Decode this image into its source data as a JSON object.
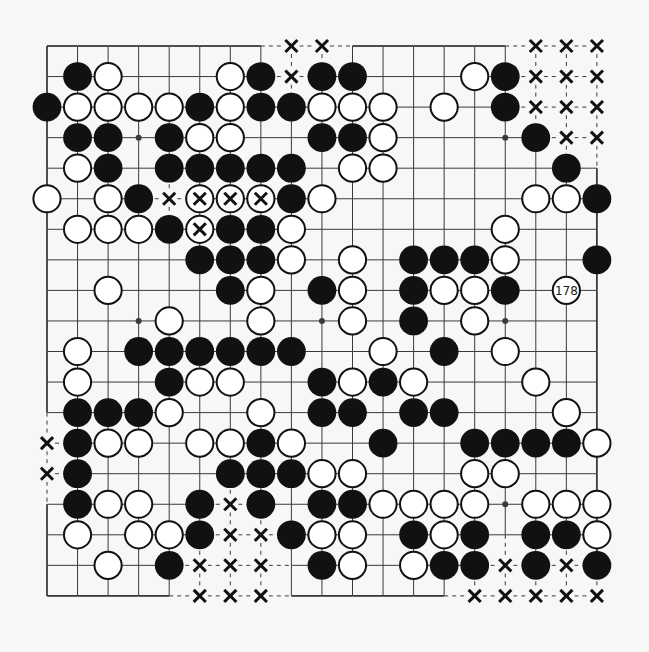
{
  "diagram": {
    "type": "go-board",
    "size": 19,
    "colors": {
      "background": "#f7f7f5",
      "line": "#3a3a3a",
      "black_stone": "#111111",
      "white_stone_fill": "#ffffff",
      "white_stone_stroke": "#111111",
      "mark": "#111111"
    },
    "hoshi": [
      [
        3,
        3
      ],
      [
        3,
        9
      ],
      [
        3,
        15
      ],
      [
        9,
        3
      ],
      [
        9,
        9
      ],
      [
        9,
        15
      ],
      [
        15,
        3
      ],
      [
        15,
        9
      ],
      [
        15,
        15
      ]
    ],
    "rows": [
      {
        "row": 0,
        "stones": [
          [
            "X",
            8
          ],
          [
            "X",
            9
          ],
          [
            "X",
            16
          ],
          [
            "X",
            17
          ],
          [
            "X",
            18
          ]
        ]
      },
      {
        "row": 1,
        "stones": [
          [
            "B",
            1
          ],
          [
            "W",
            2
          ],
          [
            "W",
            6
          ],
          [
            "B",
            7
          ],
          [
            "X",
            8
          ],
          [
            "B",
            9
          ],
          [
            "B",
            10
          ],
          [
            "W",
            14
          ],
          [
            "B",
            15
          ],
          [
            "X",
            16
          ],
          [
            "X",
            17
          ],
          [
            "X",
            18
          ]
        ]
      },
      {
        "row": 2,
        "stones": [
          [
            "B",
            0
          ],
          [
            "W",
            1
          ],
          [
            "W",
            2
          ],
          [
            "W",
            3
          ],
          [
            "W",
            4
          ],
          [
            "B",
            5
          ],
          [
            "W",
            6
          ],
          [
            "B",
            7
          ],
          [
            "B",
            8
          ],
          [
            "W",
            9
          ],
          [
            "W",
            10
          ],
          [
            "W",
            11
          ],
          [
            "W",
            13
          ],
          [
            "B",
            15
          ],
          [
            "X",
            16
          ],
          [
            "X",
            17
          ],
          [
            "X",
            18
          ]
        ]
      },
      {
        "row": 3,
        "stones": [
          [
            "B",
            1
          ],
          [
            "B",
            2
          ],
          [
            "B",
            4
          ],
          [
            "W",
            5
          ],
          [
            "W",
            6
          ],
          [
            "B",
            9
          ],
          [
            "B",
            10
          ],
          [
            "W",
            11
          ],
          [
            "B",
            16
          ],
          [
            "X",
            17
          ],
          [
            "X",
            18
          ]
        ]
      },
      {
        "row": 4,
        "stones": [
          [
            "W",
            1
          ],
          [
            "B",
            2
          ],
          [
            "B",
            4
          ],
          [
            "B",
            5
          ],
          [
            "B",
            6
          ],
          [
            "B",
            7
          ],
          [
            "B",
            8
          ],
          [
            "W",
            10
          ],
          [
            "W",
            11
          ],
          [
            "B",
            17
          ]
        ]
      },
      {
        "row": 5,
        "stones": [
          [
            "W",
            0
          ],
          [
            "W",
            2
          ],
          [
            "B",
            3
          ],
          [
            "X",
            4
          ],
          [
            "WX",
            5
          ],
          [
            "WX",
            6
          ],
          [
            "WX",
            7
          ],
          [
            "B",
            8
          ],
          [
            "W",
            9
          ],
          [
            "W",
            16
          ],
          [
            "W",
            17
          ],
          [
            "B",
            18
          ]
        ]
      },
      {
        "row": 6,
        "stones": [
          [
            "W",
            1
          ],
          [
            "W",
            2
          ],
          [
            "W",
            3
          ],
          [
            "B",
            4
          ],
          [
            "WX",
            5
          ],
          [
            "B",
            6
          ],
          [
            "B",
            7
          ],
          [
            "W",
            8
          ],
          [
            "W",
            15
          ]
        ]
      },
      {
        "row": 7,
        "stones": [
          [
            "B",
            5
          ],
          [
            "B",
            6
          ],
          [
            "B",
            7
          ],
          [
            "W",
            8
          ],
          [
            "W",
            10
          ],
          [
            "B",
            12
          ],
          [
            "B",
            13
          ],
          [
            "B",
            14
          ],
          [
            "W",
            15
          ],
          [
            "B",
            18
          ]
        ]
      },
      {
        "row": 8,
        "stones": [
          [
            "W",
            2
          ],
          [
            "B",
            6
          ],
          [
            "W",
            7
          ],
          [
            "B",
            9
          ],
          [
            "W",
            10
          ],
          [
            "B",
            12
          ],
          [
            "W",
            13
          ],
          [
            "W",
            14
          ],
          [
            "B",
            15
          ],
          [
            "N",
            17,
            "178"
          ]
        ]
      },
      {
        "row": 9,
        "stones": [
          [
            "W",
            4
          ],
          [
            "W",
            7
          ],
          [
            "W",
            10
          ],
          [
            "B",
            12
          ],
          [
            "W",
            14
          ]
        ]
      },
      {
        "row": 10,
        "stones": [
          [
            "W",
            1
          ],
          [
            "B",
            3
          ],
          [
            "B",
            4
          ],
          [
            "B",
            5
          ],
          [
            "B",
            6
          ],
          [
            "B",
            7
          ],
          [
            "B",
            8
          ],
          [
            "W",
            11
          ],
          [
            "B",
            13
          ],
          [
            "W",
            15
          ]
        ]
      },
      {
        "row": 11,
        "stones": [
          [
            "W",
            1
          ],
          [
            "B",
            4
          ],
          [
            "W",
            5
          ],
          [
            "W",
            6
          ],
          [
            "B",
            9
          ],
          [
            "W",
            10
          ],
          [
            "B",
            11
          ],
          [
            "W",
            12
          ],
          [
            "W",
            16
          ]
        ]
      },
      {
        "row": 12,
        "stones": [
          [
            "B",
            1
          ],
          [
            "B",
            2
          ],
          [
            "B",
            3
          ],
          [
            "W",
            4
          ],
          [
            "W",
            7
          ],
          [
            "B",
            9
          ],
          [
            "B",
            10
          ],
          [
            "B",
            12
          ],
          [
            "B",
            13
          ],
          [
            "W",
            17
          ]
        ]
      },
      {
        "row": 13,
        "stones": [
          [
            "X",
            0
          ],
          [
            "B",
            1
          ],
          [
            "W",
            2
          ],
          [
            "W",
            3
          ],
          [
            "W",
            5
          ],
          [
            "W",
            6
          ],
          [
            "B",
            7
          ],
          [
            "W",
            8
          ],
          [
            "B",
            11
          ],
          [
            "B",
            14
          ],
          [
            "B",
            15
          ],
          [
            "B",
            16
          ],
          [
            "B",
            17
          ],
          [
            "W",
            18
          ]
        ]
      },
      {
        "row": 14,
        "stones": [
          [
            "X",
            0
          ],
          [
            "B",
            1
          ],
          [
            "B",
            6
          ],
          [
            "B",
            7
          ],
          [
            "B",
            8
          ],
          [
            "W",
            9
          ],
          [
            "W",
            10
          ],
          [
            "W",
            14
          ],
          [
            "W",
            15
          ]
        ]
      },
      {
        "row": 15,
        "stones": [
          [
            "B",
            1
          ],
          [
            "W",
            2
          ],
          [
            "W",
            3
          ],
          [
            "B",
            5
          ],
          [
            "X",
            6
          ],
          [
            "B",
            7
          ],
          [
            "B",
            9
          ],
          [
            "B",
            10
          ],
          [
            "W",
            11
          ],
          [
            "W",
            12
          ],
          [
            "W",
            13
          ],
          [
            "W",
            14
          ],
          [
            "W",
            16
          ],
          [
            "W",
            17
          ],
          [
            "W",
            18
          ]
        ]
      },
      {
        "row": 16,
        "stones": [
          [
            "W",
            1
          ],
          [
            "W",
            3
          ],
          [
            "W",
            4
          ],
          [
            "B",
            5
          ],
          [
            "X",
            6
          ],
          [
            "X",
            7
          ],
          [
            "B",
            8
          ],
          [
            "W",
            9
          ],
          [
            "W",
            10
          ],
          [
            "B",
            12
          ],
          [
            "W",
            13
          ],
          [
            "B",
            14
          ],
          [
            "B",
            16
          ],
          [
            "B",
            17
          ],
          [
            "W",
            18
          ]
        ]
      },
      {
        "row": 17,
        "stones": [
          [
            "W",
            2
          ],
          [
            "B",
            4
          ],
          [
            "X",
            5
          ],
          [
            "X",
            6
          ],
          [
            "X",
            7
          ],
          [
            "B",
            9
          ],
          [
            "W",
            10
          ],
          [
            "W",
            12
          ],
          [
            "B",
            13
          ],
          [
            "B",
            14
          ],
          [
            "X",
            15
          ],
          [
            "B",
            16
          ],
          [
            "X",
            17
          ],
          [
            "B",
            18
          ]
        ]
      },
      {
        "row": 18,
        "stones": [
          [
            "X",
            5
          ],
          [
            "X",
            6
          ],
          [
            "X",
            7
          ],
          [
            "X",
            14
          ],
          [
            "X",
            15
          ],
          [
            "X",
            16
          ],
          [
            "X",
            17
          ],
          [
            "X",
            18
          ]
        ]
      }
    ],
    "numbered_stone": {
      "row": 8,
      "col": 17,
      "label": "178",
      "color": "white"
    },
    "legend": {
      "B": "black stone",
      "W": "white stone",
      "WX": "white stone marked with x (captured)",
      "X": "x mark on empty point",
      "N": "numbered move stone"
    }
  }
}
